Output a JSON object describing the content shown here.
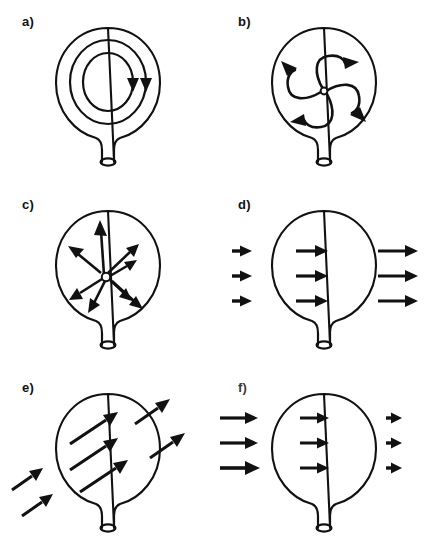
{
  "figure": {
    "background_color": "#ffffff",
    "ink_color": "#111111",
    "columns": 2,
    "rows": 3,
    "panel_width": 216,
    "panel_height": 182
  },
  "panels": [
    {
      "id": "a",
      "label": "a)",
      "caption": "Circulation: two concentric closed loops inside the balloon, clockwise",
      "pattern": "circulation",
      "arrow_count": 2,
      "arrow_direction": "clockwise",
      "center_marker": "none",
      "loops": [
        {
          "rx": 38,
          "ry": 44,
          "arrowhead": "down-right"
        },
        {
          "rx": 25,
          "ry": 31,
          "arrowhead": "down-right"
        }
      ]
    },
    {
      "id": "b",
      "label": "b)",
      "caption": "Vorticity pinwheel: four S-shaped arms spiralling out from a central point",
      "pattern": "pinwheel-vorticity",
      "arrow_count": 4,
      "arrow_direction": "counter-clockwise-outward",
      "center_marker": "open-circle",
      "arms": [
        {
          "name": "upper-right",
          "tip_angle_deg": 10
        },
        {
          "name": "lower-right",
          "tip_angle_deg": 110
        },
        {
          "name": "lower-left",
          "tip_angle_deg": 190
        },
        {
          "name": "upper-left",
          "tip_angle_deg": 290
        }
      ]
    },
    {
      "id": "c",
      "label": "c)",
      "caption": "Divergence source: eight arrows radiating outward from a central open circle",
      "pattern": "divergence-source",
      "arrow_count": 8,
      "arrow_direction": "radial-outward",
      "center_marker": "open-circle",
      "ray_angles_deg": [
        268,
        304,
        330,
        20,
        58,
        96,
        152,
        200
      ],
      "ray_lengths": [
        52,
        40,
        44,
        36,
        40,
        44,
        40,
        48
      ]
    },
    {
      "id": "d",
      "label": "d)",
      "caption": "Accelerating uniform flow: horizontal arrows grow longer from left to right",
      "pattern": "accelerating-flow",
      "arrow_count": 9,
      "arrow_direction": "left-to-right",
      "center_marker": "none",
      "groups": [
        {
          "zone": "upstream",
          "rows": 3,
          "length": 15
        },
        {
          "zone": "interior",
          "rows": 3,
          "length": 27
        },
        {
          "zone": "downstream",
          "rows": 3,
          "length": 40
        }
      ]
    },
    {
      "id": "e",
      "label": "e)",
      "caption": "Uniform oblique flow: parallel arrows tilted up to the right, entering lower-left and leaving upper-right",
      "pattern": "uniform-oblique-flow",
      "arrow_count": 7,
      "arrow_direction": "up-right-diagonal",
      "angle_deg": 35,
      "center_marker": "none",
      "groups": [
        {
          "zone": "upstream",
          "count": 2,
          "length": 34
        },
        {
          "zone": "interior",
          "count": 3,
          "length": 52
        },
        {
          "zone": "downstream",
          "count": 2,
          "length": 40
        }
      ]
    },
    {
      "id": "f",
      "label": "f)",
      "caption": "Decelerating flow: horizontal arrows shrink from left to right",
      "pattern": "decelerating-flow",
      "arrow_count": 9,
      "arrow_direction": "left-to-right",
      "center_marker": "none",
      "groups": [
        {
          "zone": "upstream",
          "rows": 3,
          "length": 40
        },
        {
          "zone": "interior",
          "rows": 3,
          "length": 27
        },
        {
          "zone": "downstream",
          "rows": 3,
          "length": 16
        }
      ]
    }
  ]
}
